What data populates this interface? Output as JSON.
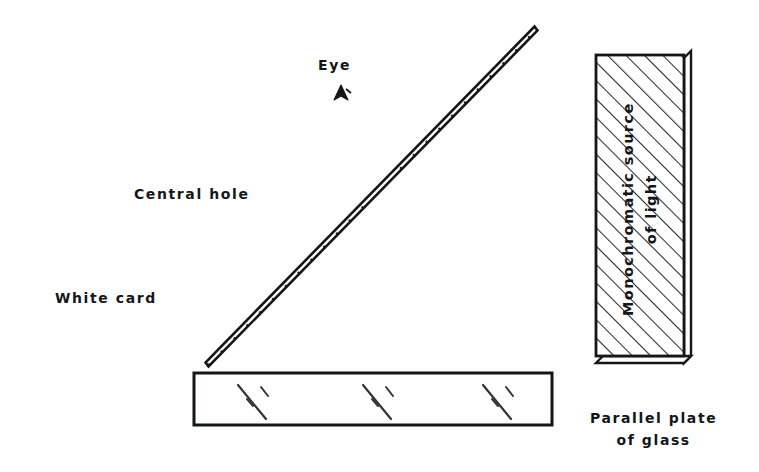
{
  "figure": {
    "domain": "diagram",
    "kind": "optics-experiment-schematic",
    "background_color": "#ffffff",
    "ink_color": "#15161a"
  },
  "labels": {
    "eye": "Eye",
    "central_hole": "Central hole",
    "white_card": "White card",
    "monochromatic_source_line1": "Monochromatic source",
    "monochromatic_source_line2": "of light",
    "parallel_plate_line1": "Parallel plate",
    "parallel_plate_line2": "of glass"
  },
  "components": {
    "white_card": {
      "name": "white-card",
      "shape": "hatched-diagonal-bar",
      "bottom_tip": [
        205,
        366
      ],
      "top_tip": [
        534,
        27
      ],
      "bar_width_px": 9,
      "hatching": "perpendicular-short-strokes",
      "central_hole_gap": {
        "from": [
          360,
          212
        ],
        "to": [
          404,
          166
        ]
      }
    },
    "eye_marker": {
      "name": "eye-marker",
      "shape": "small-arrowhead-triangle",
      "position": [
        340,
        93
      ]
    },
    "monochromatic_source": {
      "name": "monochromatic-source-box",
      "shape": "hatched-rectangle-with-side-face",
      "x": 596,
      "y": 55,
      "width": 88,
      "height": 308,
      "side_face_width": 8,
      "bottom_face_height": 7,
      "hatch_direction": "forward-slash",
      "hatch_spacing_px": 13
    },
    "parallel_plate": {
      "name": "parallel-plate-of-glass",
      "shape": "rectangle-with-glint-marks",
      "x": 194,
      "y": 373,
      "width": 358,
      "height": 52,
      "glint_count": 3,
      "glint_positions": [
        245,
        370,
        490
      ]
    }
  },
  "colors": {
    "ink": "#15161a",
    "hatch": "#2a2b30",
    "glint": "#33343a",
    "background": "#ffffff"
  }
}
